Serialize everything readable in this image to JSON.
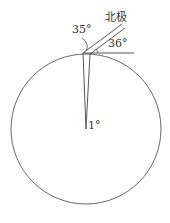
{
  "diagram": {
    "labels": {
      "north_pole": "北极",
      "angle_left": "35°",
      "angle_right": "36°",
      "center_angle": "1°"
    },
    "colors": {
      "stroke": "#444444",
      "text": "#333333"
    }
  }
}
